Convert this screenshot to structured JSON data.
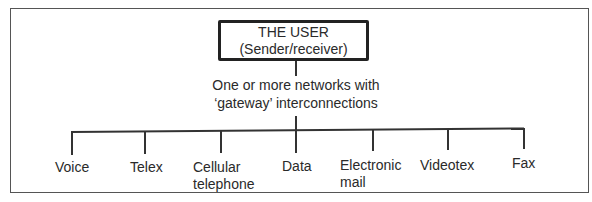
{
  "diagram": {
    "root": {
      "title": "THE USER",
      "subtitle": "(Sender/receiver)"
    },
    "network": {
      "line1": "One or more networks with",
      "line2": "‘gateway’ interconnections"
    },
    "leaves": [
      {
        "line1": "Voice",
        "line2": ""
      },
      {
        "line1": "Telex",
        "line2": ""
      },
      {
        "line1": "Cellular",
        "line2": "telephone"
      },
      {
        "line1": "Data",
        "line2": ""
      },
      {
        "line1": "Electronic",
        "line2": "mail"
      },
      {
        "line1": "Videotex",
        "line2": ""
      },
      {
        "line1": "Fax",
        "line2": ""
      }
    ]
  }
}
